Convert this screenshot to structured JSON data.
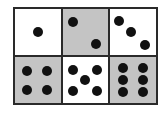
{
  "dice_grid": {
    "faces": [
      {
        "value": 1,
        "background": "#ffffff",
        "pips": [
          [
            50,
            50
          ]
        ]
      },
      {
        "value": 2,
        "background": "#c4c4c4",
        "pips": [
          [
            22,
            28
          ],
          [
            74,
            75
          ]
        ]
      },
      {
        "value": 3,
        "background": "#ffffff",
        "pips": [
          [
            18,
            25
          ],
          [
            46,
            50
          ],
          [
            76,
            78
          ]
        ]
      },
      {
        "value": 4,
        "background": "#c4c4c4",
        "pips": [
          [
            26,
            30
          ],
          [
            70,
            30
          ],
          [
            26,
            72
          ],
          [
            70,
            72
          ]
        ]
      },
      {
        "value": 5,
        "background": "#ffffff",
        "pips": [
          [
            22,
            28
          ],
          [
            76,
            28
          ],
          [
            49,
            50
          ],
          [
            22,
            74
          ],
          [
            76,
            74
          ]
        ]
      },
      {
        "value": 6,
        "background": "#c4c4c4",
        "pips": [
          [
            28,
            24
          ],
          [
            72,
            24
          ],
          [
            28,
            50
          ],
          [
            72,
            50
          ],
          [
            28,
            76
          ],
          [
            72,
            76
          ]
        ]
      }
    ]
  }
}
